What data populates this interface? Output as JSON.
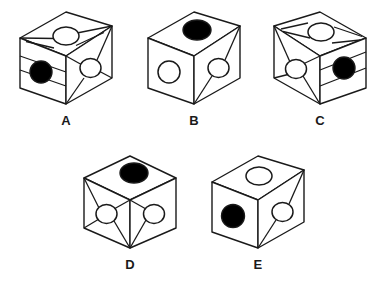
{
  "figure": {
    "kind": "spatial-reasoning-dice-puzzle",
    "background_color": "#ffffff",
    "stroke_color": "#1a1a1a",
    "fill_white": "#ffffff",
    "fill_black": "#000000",
    "label_color": "#1a1a1a"
  },
  "cubes": [
    {
      "id": "a",
      "label": "A",
      "faces": {
        "top": {
          "circle": "white",
          "pattern": "horizontal-band"
        },
        "left": {
          "circle": "black",
          "pattern": "horizontal-band"
        },
        "right": {
          "circle": "white",
          "pattern": "four-corner-star"
        }
      }
    },
    {
      "id": "b",
      "label": "B",
      "faces": {
        "top": {
          "circle": "black",
          "pattern": "none"
        },
        "left": {
          "circle": "white",
          "pattern": "none"
        },
        "right": {
          "circle": "white",
          "pattern": "two-corner-diagonal"
        }
      }
    },
    {
      "id": "c",
      "label": "C",
      "faces": {
        "top": {
          "circle": "white",
          "pattern": "horizontal-band"
        },
        "left": {
          "circle": "white",
          "pattern": "four-corner-star"
        },
        "right": {
          "circle": "black",
          "pattern": "horizontal-band"
        }
      }
    },
    {
      "id": "d",
      "label": "D",
      "faces": {
        "top": {
          "circle": "black",
          "pattern": "none"
        },
        "left": {
          "circle": "white",
          "pattern": "four-corner-star"
        },
        "right": {
          "circle": "white",
          "pattern": "two-left-corner-wedge"
        }
      }
    },
    {
      "id": "e",
      "label": "E",
      "faces": {
        "top": {
          "circle": "white",
          "pattern": "none"
        },
        "left": {
          "circle": "black",
          "pattern": "none"
        },
        "right": {
          "circle": "white",
          "pattern": "two-corner-diagonal"
        }
      }
    }
  ]
}
